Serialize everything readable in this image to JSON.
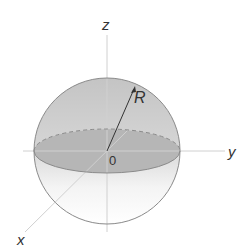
{
  "diagram": {
    "axes": {
      "x": "x",
      "y": "y",
      "z": "z"
    },
    "origin_label": "0",
    "radius_label": "R",
    "colors": {
      "upper_hemisphere": "#c8c8c8",
      "equator_disk": "#a8a8a8",
      "lower_hemisphere": "#f2f2f2",
      "outline": "#8a8a8a",
      "axis": "#cfcfcf",
      "text": "#333333"
    }
  }
}
